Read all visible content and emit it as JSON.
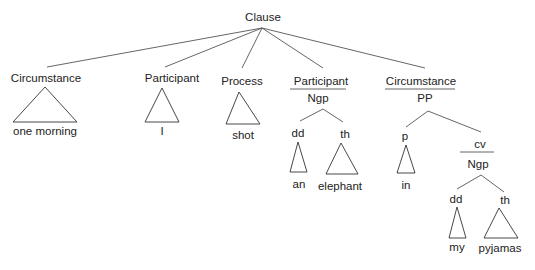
{
  "diagram": {
    "type": "syntax-tree",
    "root": "Clause",
    "nodes": {
      "root": "Clause",
      "circumstance1": {
        "function": "Circumstance",
        "text": "one morning"
      },
      "participant1": {
        "function": "Participant",
        "text": "I"
      },
      "process": {
        "function": "Process",
        "text": "shot"
      },
      "participant2": {
        "function": "Participant",
        "class": "Ngp",
        "dd": {
          "label": "dd",
          "text": "an"
        },
        "th": {
          "label": "th",
          "text": "elephant"
        }
      },
      "circumstance2": {
        "function": "Circumstance",
        "class": "PP",
        "p": {
          "label": "p",
          "text": "in"
        },
        "cv": {
          "function": "cv",
          "class": "Ngp",
          "dd": {
            "label": "dd",
            "text": "my"
          },
          "th": {
            "label": "th",
            "text": "pyjamas"
          }
        }
      }
    },
    "colors": {
      "line": "#555555",
      "text": "#222222",
      "background": "#ffffff"
    }
  }
}
